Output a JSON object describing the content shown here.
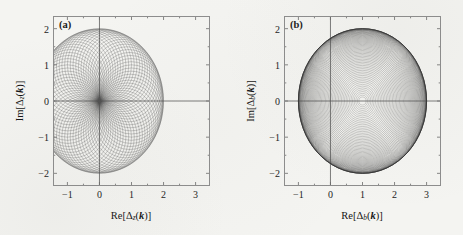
{
  "figure": {
    "background_color": "#f4f4f1",
    "line_color": "#4a4a4a",
    "frame_color": "#8d8d8d"
  },
  "panels": [
    {
      "id": "a",
      "label": "(a)",
      "xlabel_prefix": "Re[Δ",
      "xlabel_sub": "z",
      "xlabel_suffix": "(k)]",
      "ylabel_prefix": "Im[Δ",
      "ylabel_sub": "z",
      "ylabel_suffix": "(k)]",
      "xticks": [
        "−1",
        "0",
        "1",
        "2",
        "3"
      ],
      "yticks": [
        "2",
        "1",
        "0",
        "−1",
        "−2"
      ]
    },
    {
      "id": "b",
      "label": "(b)",
      "xlabel_prefix": "Re[Δ",
      "xlabel_sub": "b",
      "xlabel_suffix": "(k)]",
      "ylabel_prefix": "Im[Δ",
      "ylabel_sub": "b",
      "ylabel_suffix": "(k)]",
      "xticks": [
        "−1",
        "0",
        "1",
        "2",
        "3"
      ],
      "yticks": [
        "2",
        "1",
        "0",
        "−1",
        "−2"
      ]
    }
  ],
  "chart_data": [
    {
      "type": "line",
      "panel": "a",
      "title": "(a)",
      "xlabel": "Re[Δ_z(k)]",
      "ylabel": "Im[Δ_z(k)]",
      "xlim": [
        -1.45,
        3.45
      ],
      "ylim": [
        -2.35,
        2.35
      ],
      "xticks": [
        -1,
        0,
        1,
        2,
        3
      ],
      "yticks": [
        -2,
        -1,
        0,
        1,
        2
      ],
      "grid": false,
      "legend": null,
      "description": "Rosette family of circles in the complex order-parameter plane. Each curve is a circle of radius 1 whose centre lies on a circle of radius 1 about the origin; all curves pass through the common node at (1,0), producing a dense cardioid-like moire with an outer envelope of radius 2 centred at (1,0).",
      "curve_family": {
        "kind": "circles-through-common-node",
        "count": 72,
        "node": [
          1.0,
          0.0
        ],
        "center_locus_radius": 1.0,
        "center_locus_origin": [
          0.0,
          0.0
        ],
        "curve_radius": 1.0,
        "angle_start_deg": 0,
        "angle_step_deg": 5,
        "outer_envelope_radius": 2.0,
        "outer_envelope_center": [
          1.0,
          0.0
        ]
      }
    },
    {
      "type": "line",
      "panel": "b",
      "title": "(b)",
      "xlabel": "Re[Δ_b(k)]",
      "ylabel": "Im[Δ_b(k)]",
      "xlim": [
        -1.45,
        3.45
      ],
      "ylim": [
        -2.35,
        2.35
      ],
      "xticks": [
        -1,
        0,
        1,
        2,
        3
      ],
      "yticks": [
        -2,
        -1,
        0,
        1,
        2
      ],
      "grid": false,
      "legend": null,
      "description": "Family of concentric circles centred at (1,0) in the complex order-parameter plane. Radii run from near 0 out to 2; the spacing contracts toward the rim so the line density grows strongly at the outer edge.",
      "curve_family": {
        "kind": "concentric-circles",
        "count": 60,
        "center": [
          1.0,
          0.0
        ],
        "radius_min": 0.06,
        "radius_max": 2.0,
        "spacing": "sin-compressed toward outer edge",
        "outer_envelope_radius": 2.0
      }
    }
  ]
}
